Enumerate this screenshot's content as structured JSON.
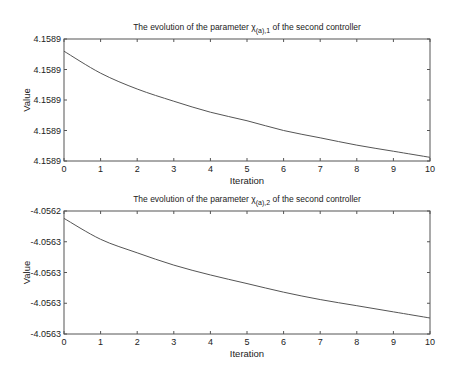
{
  "chart_data": [
    {
      "type": "line",
      "title_prefix": "The evolution of the parameter ",
      "title_symbol": "χ",
      "title_subscript": "(a),1",
      "title_suffix": " of the second controller",
      "title": "The evolution of the parameter χ(a),1 of the second controller",
      "xlabel": "Iteration",
      "ylabel": "Value",
      "xlim": [
        0,
        10
      ],
      "xticks": [
        "0",
        "1",
        "2",
        "3",
        "4",
        "5",
        "6",
        "7",
        "8",
        "9",
        "10"
      ],
      "yticks": [
        "4.1589",
        "4.1589",
        "4.1589",
        "4.1589",
        "4.1589"
      ],
      "grid": false,
      "legend": null,
      "x": [
        0,
        1,
        2,
        3,
        4,
        5,
        6,
        7,
        8,
        9,
        10
      ],
      "y_normalized": [
        0.9,
        0.72,
        0.59,
        0.49,
        0.4,
        0.33,
        0.25,
        0.19,
        0.13,
        0.08,
        0.03
      ],
      "note": "values decrease monotonically, all display as 4.1589 at shown precision"
    },
    {
      "type": "line",
      "title_prefix": "The evolution of the parameter ",
      "title_symbol": "χ",
      "title_subscript": "(a),2",
      "title_suffix": " of the second controller",
      "title": "The evolution of the parameter χ(a),2 of the second controller",
      "xlabel": "Iteration",
      "ylabel": "Value",
      "xlim": [
        0,
        10
      ],
      "xticks": [
        "0",
        "1",
        "2",
        "3",
        "4",
        "5",
        "6",
        "7",
        "8",
        "9",
        "10"
      ],
      "yticks": [
        "-4.0562",
        "-4.0563",
        "-4.0563",
        "-4.0563",
        "-4.0563"
      ],
      "grid": false,
      "legend": null,
      "x": [
        0,
        1,
        2,
        3,
        4,
        5,
        6,
        7,
        8,
        9,
        10
      ],
      "y_normalized": [
        0.94,
        0.77,
        0.66,
        0.56,
        0.48,
        0.41,
        0.34,
        0.28,
        0.23,
        0.18,
        0.13
      ],
      "note": "values decrease monotonically from about -4.05622 toward -4.05630"
    }
  ],
  "colors": {
    "line": "#555555",
    "axes": "#555555",
    "text": "#222222"
  }
}
